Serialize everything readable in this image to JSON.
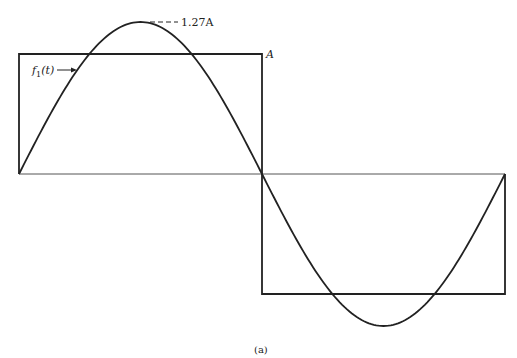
{
  "figure": {
    "caption": "(a)",
    "labels": {
      "peak": "1.27A",
      "square_amplitude": "A",
      "function_name": "f",
      "function_sub": "1",
      "function_arg": "(t)"
    },
    "colors": {
      "stroke": "#222222",
      "axis": "#555555",
      "background": "#ffffff"
    }
  },
  "chart_data": {
    "type": "line",
    "title": "",
    "series": [
      {
        "name": "square wave",
        "values_description": "+A for first half period, -A for second half period",
        "amplitude": "A"
      },
      {
        "name": "f1(t)",
        "values_description": "fundamental sine, one full period",
        "amplitude": "1.27A"
      }
    ],
    "annotations": [
      "1.27A",
      "A",
      "f1(t)",
      "(a)"
    ],
    "xlabel": "",
    "ylabel": ""
  }
}
